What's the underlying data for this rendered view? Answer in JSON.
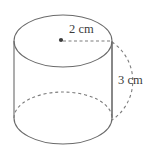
{
  "figure": {
    "kind": "cylinder-diagram",
    "background_color": "#ffffff",
    "stroke_color": "#6a6a6a",
    "dash_color": "#7d7d7d",
    "text_color": "#3b3b3b",
    "stroke_width": 1.1,
    "geometry": {
      "center_x": 63,
      "left_x": 14,
      "right_x": 112,
      "radius_x": 49,
      "radius_y": 26,
      "top_center_y": 41,
      "bottom_center_y": 118,
      "wall_height": 77
    },
    "center_dot": {
      "label": "top-face-center-dot",
      "cx": 61,
      "cy": 40,
      "r": 2.1
    },
    "radius_leader": {
      "label": "radius-dashed-line",
      "x1": 63,
      "y1": 41,
      "x2": 112,
      "y2": 41,
      "dash": "3 2.5"
    },
    "height_leader": {
      "label": "height-solid-line",
      "x1": 112,
      "y1": 42,
      "x2": 112,
      "y2": 118
    },
    "height_arc": {
      "label": "height-dashed-arc",
      "start_x": 112,
      "start_y": 42,
      "end_x": 112,
      "end_y": 120,
      "bulge_x": 140,
      "dash": "3 3"
    },
    "labels": {
      "radius": {
        "text": "2 cm",
        "x": 69,
        "y": 30
      },
      "height": {
        "text": "3 cm",
        "x": 118,
        "y": 81
      }
    },
    "parts": [
      "top-ellipse-solid",
      "left-wall",
      "right-wall",
      "bottom-ellipse-front-solid",
      "bottom-ellipse-back-dashed"
    ]
  }
}
